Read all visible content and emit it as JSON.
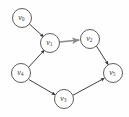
{
  "figure": {
    "type": "directed-graph",
    "background_color": "#fefefe",
    "width": 129,
    "height": 117
  },
  "style": {
    "node_stroke_color": "#4a4a4a",
    "node_fill_color": "#ffffff",
    "edge_color": "#2b2b2b",
    "highlight_edge_color": "#8a8a8a",
    "label_color": "#3a3a3a",
    "node_radius": 9.5
  },
  "nodes": [
    {
      "id": "v0",
      "base": "v",
      "sub": "0",
      "cx": 22,
      "cy": 18
    },
    {
      "id": "v1",
      "base": "v",
      "sub": "1",
      "cx": 50,
      "cy": 43
    },
    {
      "id": "v2",
      "base": "v",
      "sub": "2",
      "cx": 90,
      "cy": 39
    },
    {
      "id": "v5",
      "base": "v",
      "sub": "5",
      "cx": 113,
      "cy": 73
    },
    {
      "id": "v4",
      "base": "v",
      "sub": "4",
      "cx": 21,
      "cy": 73
    },
    {
      "id": "v3",
      "base": "v",
      "sub": "3",
      "cx": 64,
      "cy": 99
    }
  ],
  "edges": [
    {
      "id": "e-v0-v1",
      "from": "v0",
      "to": "v1",
      "highlight": false,
      "x1": 29.4,
      "y1": 24.0,
      "x2": 43.6,
      "y2": 36.9
    },
    {
      "id": "e-v4-v1",
      "from": "v4",
      "to": "v1",
      "highlight": false,
      "x1": 28.6,
      "y1": 67.2,
      "x2": 44.4,
      "y2": 50.1
    },
    {
      "id": "e-v1-v2",
      "from": "v1",
      "to": "v2",
      "highlight": true,
      "x1": 59.5,
      "y1": 42.0,
      "x2": 79.2,
      "y2": 40.0
    },
    {
      "id": "e-v2-v5",
      "from": "v2",
      "to": "v5",
      "highlight": false,
      "x1": 96.4,
      "y1": 46.0,
      "x2": 108.2,
      "y2": 64.6
    },
    {
      "id": "e-v4-v3",
      "from": "v4",
      "to": "v3",
      "highlight": false,
      "x1": 29.0,
      "y1": 79.6,
      "x2": 55.2,
      "y2": 94.8
    },
    {
      "id": "e-v3-v5",
      "from": "v3",
      "to": "v5",
      "highlight": false,
      "x1": 73.0,
      "y1": 95.2,
      "x2": 104.4,
      "y2": 78.2
    }
  ]
}
